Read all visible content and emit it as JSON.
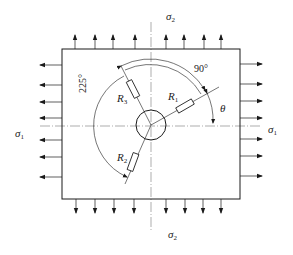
{
  "diagram": {
    "type": "strain-gauge rosette on plate under biaxial stress",
    "labels": {
      "sigma2_top": {
        "symbol": "σ",
        "sub": "2"
      },
      "sigma2_bottom": {
        "symbol": "σ",
        "sub": "2"
      },
      "sigma1_left": {
        "symbol": "σ",
        "sub": "1"
      },
      "sigma1_right": {
        "symbol": "σ",
        "sub": "1"
      },
      "R1": {
        "symbol": "R",
        "sub": "1"
      },
      "R2": {
        "symbol": "R",
        "sub": "2"
      },
      "R3": {
        "symbol": "R",
        "sub": "3"
      },
      "theta": "θ",
      "angle_90": "90°",
      "angle_225": "225°"
    },
    "colors": {
      "stroke": "#1a1a1a",
      "centerline": "#888888"
    },
    "plate": {
      "x": 62,
      "y": 49,
      "width": 178,
      "height": 150
    },
    "hole": {
      "cx": 151,
      "cy": 125,
      "r": 15
    },
    "top_arrows_x": [
      75,
      95,
      113,
      135,
      166,
      184,
      204,
      221
    ],
    "bottom_arrows_x": [
      76,
      95,
      114,
      134,
      166,
      185,
      203,
      221
    ],
    "left_arrows_y": [
      65,
      85,
      102,
      118,
      140,
      157,
      177
    ],
    "right_arrows_y": [
      64,
      84,
      101,
      118,
      139,
      156,
      176
    ],
    "gauge_angles_deg": {
      "R1": 30,
      "R3": 120,
      "R2": 255
    }
  }
}
